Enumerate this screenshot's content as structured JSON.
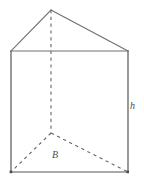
{
  "figure": {
    "name": "triangular-prism",
    "shape_type": "triangular prism",
    "background_color": "#ffffff",
    "width": 144,
    "height": 183,
    "stroke_color_visible": "#6f7072",
    "stroke_color_edge": "#555658",
    "stroke_color_hidden": "#65666a"
  },
  "labels": {
    "height": "h",
    "base": "B"
  },
  "vertices": {
    "apex_front_top": {
      "x": 51,
      "y": 10
    },
    "top_left": {
      "x": 11,
      "y": 51
    },
    "top_right": {
      "x": 128,
      "y": 51
    },
    "bottom_left": {
      "x": 11,
      "y": 172
    },
    "bottom_right": {
      "x": 128,
      "y": 172
    },
    "back_bottom_hidden": {
      "x": 51,
      "y": 133
    }
  },
  "edges": [
    {
      "id": "apex-to-top-left",
      "style": "solid",
      "from": "apex_front_top",
      "to": "top_left"
    },
    {
      "id": "apex-to-top-right",
      "style": "solid",
      "from": "apex_front_top",
      "to": "top_right"
    },
    {
      "id": "top-front-edge",
      "style": "solid",
      "from": "top_left",
      "to": "top_right"
    },
    {
      "id": "left-vertical-edge",
      "style": "solid",
      "from": "top_left",
      "to": "bottom_left"
    },
    {
      "id": "right-vertical-edge",
      "style": "solid",
      "from": "top_right",
      "to": "bottom_right"
    },
    {
      "id": "bottom-front-edge",
      "style": "solid",
      "from": "bottom_left",
      "to": "bottom_right"
    },
    {
      "id": "hidden-vertical-edge",
      "style": "dashed",
      "from": "apex_front_top",
      "to": "back_bottom_hidden"
    },
    {
      "id": "hidden-base-left-edge",
      "style": "dashed",
      "from": "back_bottom_hidden",
      "to": "bottom_left"
    },
    {
      "id": "hidden-base-right-edge",
      "style": "dashed",
      "from": "back_bottom_hidden",
      "to": "bottom_right"
    }
  ]
}
